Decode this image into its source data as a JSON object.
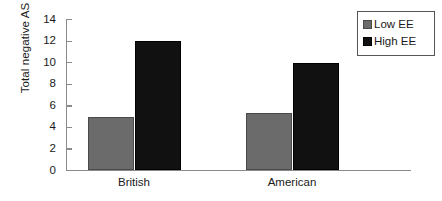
{
  "chart_data": {
    "type": "bar",
    "title": "",
    "xlabel": "",
    "ylabel": "Total negative AS",
    "categories": [
      "British",
      "American"
    ],
    "series": [
      {
        "name": "Low EE",
        "color": "#6b6b6b",
        "values": [
          5.0,
          5.3
        ]
      },
      {
        "name": "High EE",
        "color": "#111111",
        "values": [
          12.0,
          10.0
        ]
      }
    ],
    "ylim": [
      0,
      14
    ],
    "ytick_labels": [
      "0",
      "2",
      "4",
      "6",
      "8",
      "10",
      "12",
      "14"
    ],
    "ytick_values": [
      0,
      2,
      4,
      6,
      8,
      10,
      12,
      14
    ],
    "grid": false,
    "legend_position": "top-right",
    "legend_entries": [
      "Low EE",
      "High EE"
    ]
  },
  "axes": {
    "y_title": "Total negative AS"
  },
  "legend": {
    "items": [
      {
        "label": "Low EE"
      },
      {
        "label": "High EE"
      }
    ]
  }
}
